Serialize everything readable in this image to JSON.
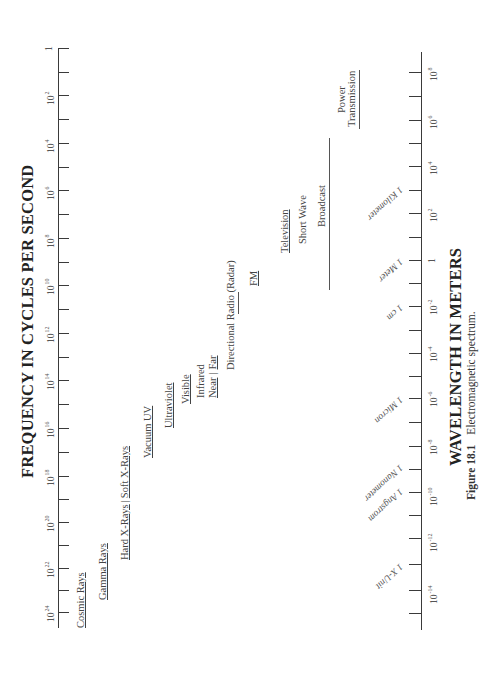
{
  "figure": {
    "caption_label": "Figure 18.1",
    "caption_text": "Electromagnetic spectrum."
  },
  "frequency_axis": {
    "title": "FREQUENCY IN CYCLES PER SECOND",
    "ticks": [
      {
        "base": "1",
        "exp": "",
        "y": 48
      },
      {
        "base": "10",
        "exp": "2",
        "y": 95
      },
      {
        "base": "10",
        "exp": "4",
        "y": 143
      },
      {
        "base": "10",
        "exp": "6",
        "y": 190
      },
      {
        "base": "10",
        "exp": "8",
        "y": 238
      },
      {
        "base": "10",
        "exp": "10",
        "y": 285
      },
      {
        "base": "10",
        "exp": "12",
        "y": 333
      },
      {
        "base": "10",
        "exp": "14",
        "y": 380
      },
      {
        "base": "10",
        "exp": "16",
        "y": 428
      },
      {
        "base": "10",
        "exp": "18",
        "y": 476
      },
      {
        "base": "10",
        "exp": "20",
        "y": 522
      },
      {
        "base": "10",
        "exp": "22",
        "y": 568
      },
      {
        "base": "10",
        "exp": "24",
        "y": 612
      }
    ]
  },
  "wavelength_axis": {
    "title": "WAVELENGTH IN METERS",
    "ticks": [
      {
        "base": "10",
        "exp": "8",
        "y": 72
      },
      {
        "base": "10",
        "exp": "6",
        "y": 120
      },
      {
        "base": "10",
        "exp": "4",
        "y": 166
      },
      {
        "base": "10",
        "exp": "2",
        "y": 213
      },
      {
        "base": "1",
        "exp": "",
        "y": 260
      },
      {
        "base": "10",
        "exp": "-2",
        "y": 306
      },
      {
        "base": "10",
        "exp": "-4",
        "y": 353
      },
      {
        "base": "10",
        "exp": "-6",
        "y": 398
      },
      {
        "base": "10",
        "exp": "-8",
        "y": 446
      },
      {
        "base": "10",
        "exp": "-10",
        "y": 492
      },
      {
        "base": "10",
        "exp": "-12",
        "y": 538
      },
      {
        "base": "10",
        "exp": "-14",
        "y": 590
      }
    ],
    "markers": [
      {
        "label": "1 Kilometer",
        "y": 190
      },
      {
        "label": "1 Meter",
        "y": 262
      },
      {
        "label": "1 cm",
        "y": 308
      },
      {
        "label": "1 Micron",
        "y": 400
      },
      {
        "label": "1 Nanometer",
        "y": 468
      },
      {
        "label": "1 Angstrom",
        "y": 492
      },
      {
        "label": "1 X-Unit",
        "y": 567
      }
    ]
  },
  "bands": [
    {
      "id": "cosmic-rays",
      "label": "Cosmic Rays"
    },
    {
      "id": "gamma-rays",
      "label": "Gamma Rays"
    },
    {
      "id": "hard-x-rays",
      "label": "Hard X-Rays"
    },
    {
      "id": "soft-x-rays",
      "label": "Soft X-Rays"
    },
    {
      "id": "vacuum-uv",
      "label": "Vacuum UV"
    },
    {
      "id": "ultraviolet",
      "label": "Ultraviolet"
    },
    {
      "id": "visible",
      "label": "Visible"
    },
    {
      "id": "infrared",
      "label": "Infrared"
    },
    {
      "id": "infrared-near",
      "label": "Near"
    },
    {
      "id": "infrared-far",
      "label": "Far"
    },
    {
      "id": "directional-radio",
      "label": "Directional Radio (Radar)"
    },
    {
      "id": "fm",
      "label": "FM"
    },
    {
      "id": "television",
      "label": "Television"
    },
    {
      "id": "short-wave",
      "label": "Short Wave"
    },
    {
      "id": "broadcast",
      "label": "Broadcast"
    },
    {
      "id": "power",
      "label": "Power"
    },
    {
      "id": "transmission",
      "label": "Transmission"
    }
  ],
  "chart_data": {
    "type": "table",
    "title": "Electromagnetic spectrum",
    "x_axis_top": {
      "label": "FREQUENCY IN CYCLES PER SECOND",
      "scale": "log10",
      "range": [
        0,
        24
      ],
      "tick_labels": [
        "1",
        "10^2",
        "10^4",
        "10^6",
        "10^8",
        "10^10",
        "10^12",
        "10^14",
        "10^16",
        "10^18",
        "10^20",
        "10^22",
        "10^24"
      ]
    },
    "x_axis_bottom": {
      "label": "WAVELENGTH IN METERS",
      "scale": "log10",
      "range": [
        8,
        -14
      ],
      "tick_labels": [
        "10^8",
        "10^6",
        "10^4",
        "10^2",
        "1",
        "10^-2",
        "10^-4",
        "10^-6",
        "10^-8",
        "10^-10",
        "10^-12",
        "10^-14"
      ]
    },
    "wavelength_markers": [
      "1 Kilometer",
      "1 Meter",
      "1 cm",
      "1 Micron",
      "1 Nanometer",
      "1 Angstrom",
      "1 X-Unit"
    ],
    "bands_low_to_high_frequency": [
      "Power Transmission",
      "Broadcast",
      "Short Wave",
      "Television",
      "FM",
      "Directional Radio (Radar)",
      "Infrared (Far | Near)",
      "Visible",
      "Ultraviolet",
      "Vacuum UV",
      "Soft X-Rays",
      "Hard X-Rays",
      "Gamma Rays",
      "Cosmic Rays"
    ]
  }
}
